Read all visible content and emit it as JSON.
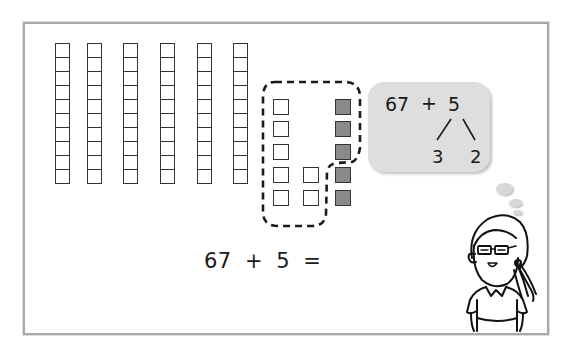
{
  "scene": {
    "description": "Base-ten blocks: 6 tens rods and 7 ones cubes plus 5 shaded ones cubes, with a thought bubble showing number decomposition",
    "tens_rods": {
      "count": 6,
      "cells_per_rod": 10
    },
    "ones_unshaded": {
      "count": 7
    },
    "ones_shaded": {
      "count": 5
    },
    "grouping": "3 shaded cubes grouped with 7 unshaded cubes to make a ten"
  },
  "thought_bubble": {
    "left": "67",
    "operator": "+",
    "right": "5",
    "split_left": "3",
    "split_right": "2"
  },
  "equation": {
    "text": "67  +  5  ="
  },
  "colors": {
    "frame": "#a8a8a8",
    "shaded_cube": "#8a8a8a",
    "bubble": "#dedede",
    "ink": "#1a1a1a"
  },
  "character": {
    "name": "girl-with-glasses"
  }
}
